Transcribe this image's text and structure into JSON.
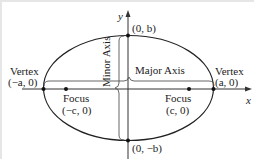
{
  "diagram": {
    "type": "ellipse-anatomy",
    "axes": {
      "x_label": "x",
      "y_label": "y"
    },
    "major_axis_label": "Major Axis",
    "minor_axis_label": "Minor Axis",
    "points": [
      {
        "id": "vertex-left",
        "name": "Vertex",
        "coord": "(−a, 0)"
      },
      {
        "id": "vertex-right",
        "name": "Vertex",
        "coord": "(a, 0)"
      },
      {
        "id": "focus-left",
        "name": "Focus",
        "coord": "(−c, 0)"
      },
      {
        "id": "focus-right",
        "name": "Focus",
        "coord": "(c, 0)"
      },
      {
        "id": "co-vertex-top",
        "name": "",
        "coord": "(0, b)"
      },
      {
        "id": "co-vertex-bottom",
        "name": "",
        "coord": "(0, −b)"
      }
    ],
    "colors": {
      "stroke": "#222222",
      "bracket": "#555555",
      "border": "#e6e6e6",
      "background": "#ffffff"
    }
  }
}
